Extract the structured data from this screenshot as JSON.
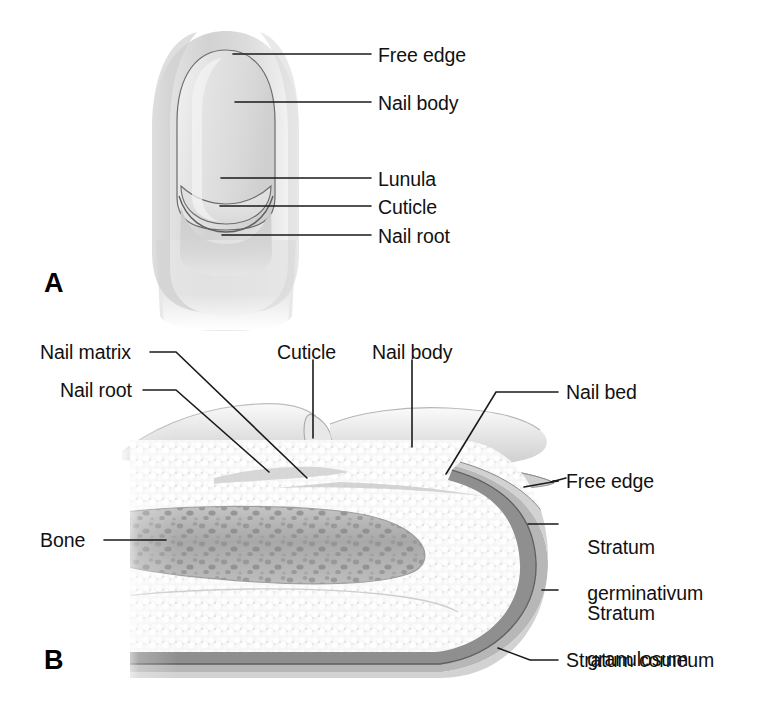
{
  "figure": {
    "background_color": "#ffffff",
    "line_color": "#1a1a1a",
    "text_color": "#111111"
  },
  "panels": [
    {
      "letter": "A",
      "name": "surface-view-of-fingernail",
      "labels": [
        {
          "id": "free-edge",
          "text": "Free edge"
        },
        {
          "id": "nail-body",
          "text": "Nail body"
        },
        {
          "id": "lunula",
          "text": "Lunula"
        },
        {
          "id": "cuticle",
          "text": "Cuticle"
        },
        {
          "id": "nail-root",
          "text": "Nail root"
        }
      ]
    },
    {
      "letter": "B",
      "name": "sagittal-section-of-fingertip",
      "labels": [
        {
          "id": "nail-matrix",
          "text": "Nail matrix"
        },
        {
          "id": "nail-root",
          "text": "Nail root"
        },
        {
          "id": "cuticle",
          "text": "Cuticle"
        },
        {
          "id": "nail-body",
          "text": "Nail body"
        },
        {
          "id": "nail-bed",
          "text": "Nail bed"
        },
        {
          "id": "free-edge",
          "text": "Free edge"
        },
        {
          "id": "bone",
          "text": "Bone"
        },
        {
          "id": "stratum-germinativum",
          "text": "Stratum\ngerminativum",
          "line1": "Stratum",
          "line2": "germinativum"
        },
        {
          "id": "stratum-granulosum",
          "text": "Stratum\ngranulosum",
          "line1": "Stratum",
          "line2": "granulosum"
        },
        {
          "id": "stratum-corneum",
          "text": "Stratum corneum"
        }
      ]
    }
  ],
  "colors": {
    "skin_light": "#ececec",
    "skin_mid": "#d8d8d8",
    "skin_shadow": "#c2c2c2",
    "nail_plate": "#e8e8e8",
    "nail_plate_edge": "#b9b9b9",
    "dermis_stipple": "#f4f4f4",
    "bone_fill": "#b0b0b0",
    "bone_speck": "#8a8a8a",
    "stratum_germ": "#8d8d8d",
    "stratum_gran": "#b5b5b5",
    "stratum_corn": "#d0d0d0",
    "outline": "#555555"
  }
}
